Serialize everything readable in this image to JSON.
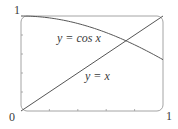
{
  "chart_data": {
    "type": "line",
    "title": "",
    "xlabel": "",
    "ylabel": "",
    "xlim": [
      0,
      1
    ],
    "ylim": [
      0,
      1
    ],
    "grid": false,
    "legend": null,
    "tick_labels": {
      "origin": "0",
      "x_max": "1",
      "y_max": "1"
    },
    "x_ticks": [
      0,
      0.2,
      0.4,
      0.6,
      0.8,
      1
    ],
    "y_ticks": [
      0,
      0.2,
      0.4,
      0.6,
      0.8,
      1
    ],
    "series": [
      {
        "name": "y = cos x",
        "label": "y = cos x",
        "x": [
          0,
          0.1,
          0.2,
          0.3,
          0.4,
          0.5,
          0.6,
          0.7,
          0.8,
          0.9,
          1.0
        ],
        "y": [
          1.0,
          0.995,
          0.98,
          0.955,
          0.921,
          0.878,
          0.825,
          0.765,
          0.697,
          0.622,
          0.54
        ]
      },
      {
        "name": "y = x",
        "label": "y = x",
        "x": [
          0,
          1
        ],
        "y": [
          0,
          1
        ]
      }
    ],
    "annotations": [
      {
        "text": "y = cos x",
        "near": [
          0.45,
          0.8
        ]
      },
      {
        "text": "y = x",
        "near": [
          0.55,
          0.35
        ]
      }
    ],
    "intersection": {
      "x": 0.739,
      "y": 0.739
    }
  },
  "colors": {
    "line": "#555555",
    "frame": "#888888",
    "text": "#3a3a3a"
  }
}
